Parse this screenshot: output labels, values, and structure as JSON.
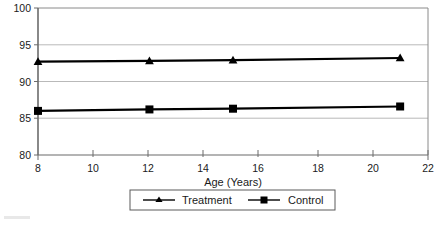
{
  "chart_data": {
    "type": "line",
    "title": "",
    "xlabel": "Age (Years)",
    "ylabel": "",
    "xlim": [
      8,
      22
    ],
    "ylim": [
      80,
      100
    ],
    "xticks": [
      8,
      10,
      12,
      14,
      16,
      18,
      20,
      22
    ],
    "yticks": [
      80,
      85,
      90,
      95,
      100
    ],
    "grid": "horizontal",
    "legend_position": "bottom-center",
    "x": [
      8,
      12,
      15,
      21
    ],
    "series": [
      {
        "name": "Treatment",
        "marker": "triangle",
        "color": "#000000",
        "values": [
          92.7,
          92.8,
          92.9,
          93.2
        ]
      },
      {
        "name": "Control",
        "marker": "square",
        "color": "#000000",
        "values": [
          86.0,
          86.2,
          86.3,
          86.6
        ]
      }
    ]
  },
  "axes": {
    "x_tick_labels": [
      "8",
      "10",
      "12",
      "14",
      "16",
      "18",
      "20",
      "22"
    ],
    "y_tick_labels": [
      "80",
      "85",
      "90",
      "95",
      "100"
    ],
    "x_axis_title": "Age (Years)"
  },
  "legend": {
    "entries": [
      {
        "label": "Treatment",
        "marker": "triangle-marker"
      },
      {
        "label": "Control",
        "marker": "square-marker"
      }
    ]
  }
}
